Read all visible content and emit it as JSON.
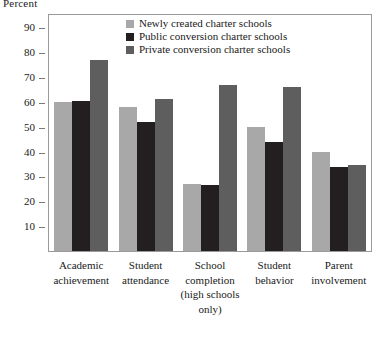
{
  "chart_data": {
    "type": "bar",
    "title": "",
    "xlabel": "",
    "ylabel": "Percent",
    "ylim": [
      0,
      95
    ],
    "yticks": [
      10,
      20,
      30,
      40,
      50,
      60,
      70,
      80,
      90
    ],
    "grid": false,
    "legend_position": "top-center",
    "categories": [
      "Academic\nachievement",
      "Student\nattendance",
      "School\ncompletion\n(high schools\nonly)",
      "Student\nbehavior",
      "Parent\ninvolvement"
    ],
    "series": [
      {
        "name": "Newly created charter schools",
        "color": "#a8a8a8",
        "values": [
          60,
          58,
          27,
          50,
          40
        ]
      },
      {
        "name": "Public conversion charter schools",
        "color": "#231f20",
        "values": [
          60.5,
          52,
          26.5,
          44,
          34
        ]
      },
      {
        "name": "Private conversion charter schools",
        "color": "#5e5e5e",
        "values": [
          77,
          61,
          67,
          66,
          34.5
        ]
      }
    ]
  },
  "axis": {
    "y_title": "Percent",
    "tick_labels": [
      "90",
      "80",
      "70",
      "60",
      "50",
      "40",
      "30",
      "20",
      "10"
    ]
  },
  "legend": {
    "items": [
      {
        "label": "Newly created charter schools",
        "color": "#a8a8a8"
      },
      {
        "label": "Public conversion charter schools",
        "color": "#231f20"
      },
      {
        "label": "Private conversion charter schools",
        "color": "#5e5e5e"
      }
    ]
  }
}
